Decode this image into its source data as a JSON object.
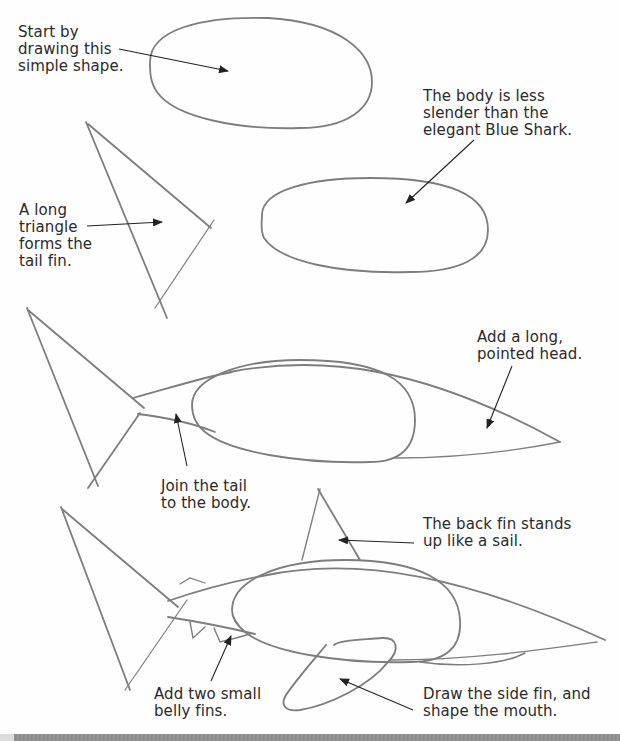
{
  "tutorial": {
    "subject": "Shark drawing steps",
    "captions": {
      "step1": "Start by\ndrawing this\nsimple shape.",
      "step2_body": "The body is less\nslender than the\nelegant Blue Shark.",
      "step2_tail": "A long\ntriangle\nforms the\ntail fin.",
      "step3_head": "Add a long,\npointed head.",
      "step3_join": "Join the tail\nto the body.",
      "step4_backfin": "The back fin stands\nup like a sail.",
      "step4_bellyfins": "Add two small\nbelly fins.",
      "step4_sidefin": "Draw the side fin, and\nshape the mouth."
    }
  },
  "colors": {
    "pencil": "#7d7d7d",
    "arrow": "#222222",
    "text": "#2a2a2a",
    "bottom_bar": "#8a8a8a"
  }
}
